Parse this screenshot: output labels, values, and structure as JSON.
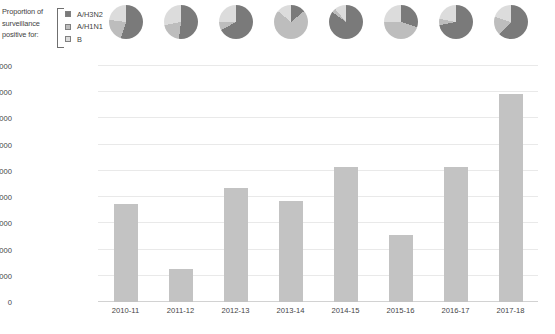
{
  "legend": {
    "caption_lines": [
      "Proportion of",
      "surveillance",
      "positive for:"
    ],
    "items": [
      {
        "label": "A/H3N2",
        "color": "#7a7a7a"
      },
      {
        "label": "A/H1N1",
        "color": "#bdbdbd"
      },
      {
        "label": "B",
        "color": "#dcdcdc"
      }
    ]
  },
  "chart_data": {
    "type": "bar",
    "title": "",
    "xlabel": "",
    "ylabel": "Estimated influenza related mortality, US",
    "categories": [
      "2010-11",
      "2011-12",
      "2012-13",
      "2013-14",
      "2014-15",
      "2015-16",
      "2016-17",
      "2017-18"
    ],
    "values": [
      37500,
      12500,
      43500,
      38500,
      51500,
      25500,
      51500,
      79500
    ],
    "ylim": [
      0,
      90000
    ],
    "yticks": [
      0,
      10000,
      20000,
      30000,
      40000,
      50000,
      60000,
      70000,
      80000,
      90000
    ],
    "ytick_labels": [
      "0",
      "10000",
      "20000",
      "30000",
      "40000",
      "50000",
      "60000",
      "70000",
      "80000",
      "90000"
    ],
    "grid": true,
    "bar_color": "#c3c3c3",
    "legend_position": "top-left",
    "pies": [
      {
        "season": "2010-11",
        "slices": [
          {
            "name": "A/H3N2",
            "value": 55
          },
          {
            "name": "A/H1N1",
            "value": 22
          },
          {
            "name": "B",
            "value": 23
          }
        ]
      },
      {
        "season": "2011-12",
        "slices": [
          {
            "name": "A/H3N2",
            "value": 52
          },
          {
            "name": "A/H1N1",
            "value": 20
          },
          {
            "name": "B",
            "value": 28
          }
        ]
      },
      {
        "season": "2012-13",
        "slices": [
          {
            "name": "A/H3N2",
            "value": 67
          },
          {
            "name": "A/H1N1",
            "value": 8
          },
          {
            "name": "B",
            "value": 25
          }
        ]
      },
      {
        "season": "2013-14",
        "slices": [
          {
            "name": "A/H3N2",
            "value": 14
          },
          {
            "name": "A/H1N1",
            "value": 72
          },
          {
            "name": "B",
            "value": 14
          }
        ]
      },
      {
        "season": "2014-15",
        "slices": [
          {
            "name": "A/H3N2",
            "value": 85
          },
          {
            "name": "A/H1N1",
            "value": 4
          },
          {
            "name": "B",
            "value": 11
          }
        ]
      },
      {
        "season": "2015-16",
        "slices": [
          {
            "name": "A/H3N2",
            "value": 30
          },
          {
            "name": "A/H1N1",
            "value": 45
          },
          {
            "name": "B",
            "value": 25
          }
        ]
      },
      {
        "season": "2016-17",
        "slices": [
          {
            "name": "A/H3N2",
            "value": 72
          },
          {
            "name": "A/H1N1",
            "value": 6
          },
          {
            "name": "B",
            "value": 22
          }
        ]
      },
      {
        "season": "2017-18",
        "slices": [
          {
            "name": "A/H3N2",
            "value": 62
          },
          {
            "name": "A/H1N1",
            "value": 18
          },
          {
            "name": "B",
            "value": 20
          }
        ]
      }
    ]
  }
}
